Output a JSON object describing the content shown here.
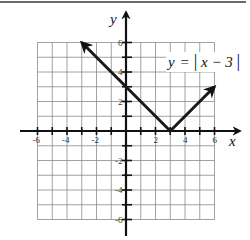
{
  "chart_data": {
    "type": "line",
    "title": "",
    "function": "y = |x - 3|",
    "xlabel": "x",
    "ylabel": "y",
    "xlim": [
      -6,
      6
    ],
    "ylim": [
      -6,
      6
    ],
    "grid": true,
    "x_tick_labels": [
      "-6",
      "-4",
      "-2",
      "2",
      "4",
      "6"
    ],
    "y_tick_labels": [
      "6",
      "4",
      "2",
      "-2",
      "-4",
      "-6"
    ],
    "series": [
      {
        "name": "y = |x - 3|",
        "points": [
          {
            "x": -3,
            "y": 6
          },
          {
            "x": 0,
            "y": 3
          },
          {
            "x": 3,
            "y": 0
          },
          {
            "x": 6,
            "y": 3
          }
        ],
        "arrows_at_ends": true
      }
    ],
    "annotations": [
      {
        "text": "y = |x - 3|",
        "x": 4.6,
        "y": 4.5
      }
    ]
  },
  "labels": {
    "x_axis": "x",
    "y_axis": "y",
    "equation_lhs": "y",
    "equation_eq": "=",
    "equation_bar_open": "|",
    "equation_body": "x − 3",
    "equation_bar_close": "|"
  },
  "ticks": {
    "x": [
      {
        "value": -6,
        "label": "-6"
      },
      {
        "value": -4,
        "label": "-4"
      },
      {
        "value": -2,
        "label": "-2"
      },
      {
        "value": 2,
        "label": "2"
      },
      {
        "value": 4,
        "label": "4"
      },
      {
        "value": 6,
        "label": "6"
      }
    ],
    "y": [
      {
        "value": 6,
        "label": "6"
      },
      {
        "value": 4,
        "label": "4"
      },
      {
        "value": 2,
        "label": "2"
      },
      {
        "value": -2,
        "label": "-2"
      },
      {
        "value": -4,
        "label": "-4"
      },
      {
        "value": -6,
        "label": "-6"
      }
    ]
  },
  "colors": {
    "grid": "#8a8a8a",
    "axis": "#111111",
    "curve": "#1a1a1a",
    "background": "#ffffff"
  }
}
